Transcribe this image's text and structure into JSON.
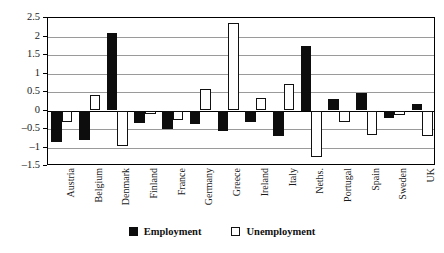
{
  "chart_data": {
    "type": "bar",
    "title": "",
    "subtitle": "",
    "xlabel": "",
    "ylabel": "",
    "ylim": [
      -1.5,
      2.5
    ],
    "yticks": [
      2.5,
      2,
      1.5,
      1,
      0.5,
      0,
      -0.5,
      -1,
      -1.5
    ],
    "ytick_labels": [
      "2.5",
      "2",
      "1.5",
      "1",
      "0.5",
      "0",
      "–0.5",
      "–1",
      "–1.5"
    ],
    "grid": true,
    "legend_position": "bottom-center",
    "categories": [
      "Austria",
      "Belgium",
      "Denmark",
      "Finland",
      "France",
      "Germany",
      "Greece",
      "Ireland",
      "Italy",
      "Neths.",
      "Portugal",
      "Spain",
      "Sweden",
      "UK"
    ],
    "series": [
      {
        "name": "Employment",
        "color": "#0d0d0d",
        "values": [
          -0.85,
          -0.8,
          2.1,
          -0.35,
          -0.5,
          -0.37,
          -0.55,
          -0.32,
          -0.68,
          1.75,
          0.32,
          0.48,
          -0.2,
          0.17
        ]
      },
      {
        "name": "Unemployment",
        "color": "#ffffff",
        "values": [
          -0.3,
          0.42,
          -0.95,
          -0.1,
          -0.27,
          0.58,
          2.37,
          0.33,
          0.72,
          -1.25,
          -0.3,
          -0.65,
          -0.12,
          -0.68
        ]
      }
    ]
  },
  "legend": {
    "entries": [
      {
        "label": "Employment",
        "style": "filled"
      },
      {
        "label": "Unemployment",
        "style": "hollow"
      }
    ]
  }
}
